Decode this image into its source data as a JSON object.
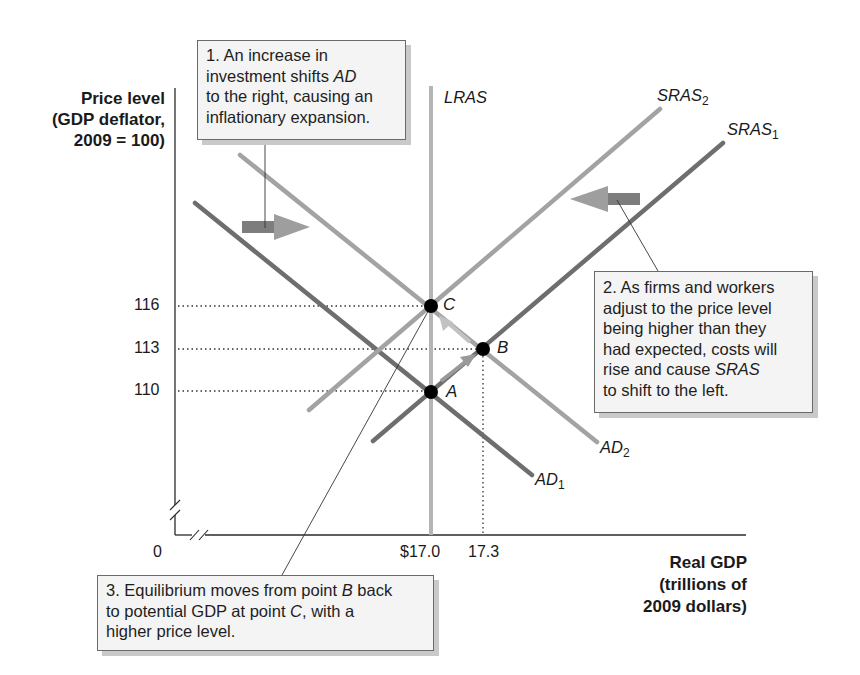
{
  "chart_data": {
    "type": "line",
    "title": "",
    "ylabel": "Price level (GDP deflator, 2009 = 100)",
    "ylabel_lines": [
      "Price level",
      "(GDP deflator,",
      "2009 = 100)"
    ],
    "xlabel": "Real GDP (trillions of 2009 dollars)",
    "xlabel_lines": [
      "Real GDP",
      "(trillions of",
      "2009 dollars)"
    ],
    "origin_label": "0",
    "y_ticks": [
      "110",
      "113",
      "116"
    ],
    "x_ticks": [
      "$17.0",
      "17.3"
    ],
    "axis_breaks": true,
    "grid": false,
    "series": [
      {
        "name": "LRAS",
        "kind": "vertical",
        "x": 17.0,
        "color": "#b5b5b5"
      },
      {
        "name": "SRAS1",
        "label_main": "SRAS",
        "label_sub": "1",
        "kind": "upward",
        "passes_through": [
          [
            17.0,
            110
          ],
          [
            17.3,
            113
          ]
        ],
        "color": "#6e6e6e"
      },
      {
        "name": "SRAS2",
        "label_main": "SRAS",
        "label_sub": "2",
        "kind": "upward",
        "passes_through": [
          [
            17.0,
            116
          ]
        ],
        "color": "#a3a3a3"
      },
      {
        "name": "AD1",
        "label_main": "AD",
        "label_sub": "1",
        "kind": "downward",
        "passes_through": [
          [
            17.0,
            110
          ]
        ],
        "color": "#6e6e6e"
      },
      {
        "name": "AD2",
        "label_main": "AD",
        "label_sub": "2",
        "kind": "downward",
        "passes_through": [
          [
            17.3,
            113
          ],
          [
            17.0,
            116
          ]
        ],
        "color": "#a3a3a3"
      }
    ],
    "points": [
      {
        "label": "A",
        "x": 17.0,
        "y": 110
      },
      {
        "label": "B",
        "x": 17.3,
        "y": 113
      },
      {
        "label": "C",
        "x": 17.0,
        "y": 116
      }
    ],
    "annotations": [
      {
        "id": 1,
        "parts": [
          {
            "t": "1.  An increase in"
          },
          {
            "br": true
          },
          {
            "t": "investment shifts "
          },
          {
            "t": "AD",
            "i": true
          },
          {
            "br": true
          },
          {
            "t": "to the right, causing an"
          },
          {
            "br": true
          },
          {
            "t": "inflationary expansion."
          }
        ],
        "text": "1. An increase in investment shifts AD to the right, causing an inflationary expansion."
      },
      {
        "id": 2,
        "parts": [
          {
            "t": "2. As firms and workers"
          },
          {
            "br": true
          },
          {
            "t": "adjust to the price level"
          },
          {
            "br": true
          },
          {
            "t": "being higher than they"
          },
          {
            "br": true
          },
          {
            "t": "had expected, costs will"
          },
          {
            "br": true
          },
          {
            "t": "rise and cause "
          },
          {
            "t": "SRAS",
            "i": true
          },
          {
            "br": true
          },
          {
            "t": "to shift to the left."
          }
        ],
        "text": "2. As firms and workers adjust to the price level being higher than they had expected, costs will rise and cause SRAS to shift to the left."
      },
      {
        "id": 3,
        "parts": [
          {
            "t": "3. Equilibrium moves from point "
          },
          {
            "t": "B",
            "i": true
          },
          {
            "t": " back"
          },
          {
            "br": true
          },
          {
            "t": "to potential GDP at point "
          },
          {
            "t": "C",
            "i": true
          },
          {
            "t": ", with a"
          },
          {
            "br": true
          },
          {
            "t": "higher price level."
          }
        ],
        "text": "3. Equilibrium moves from point B back to potential GDP at point C, with a higher price level."
      }
    ],
    "shift_arrows": [
      {
        "direction": "right",
        "meaning": "AD1 to AD2"
      },
      {
        "direction": "left",
        "meaning": "SRAS1 to SRAS2"
      }
    ]
  },
  "colors": {
    "dark_curve": "#6e6e6e",
    "light_curve": "#a3a3a3",
    "lras": "#b5b5b5",
    "arrow_dark": "#7d7d7d",
    "arrow_light": "#b3b3b3",
    "axis": "#2a2a2a",
    "point": "#000000",
    "box_bg": "#f4f4f4",
    "box_shadow": "#c9c9c9"
  }
}
